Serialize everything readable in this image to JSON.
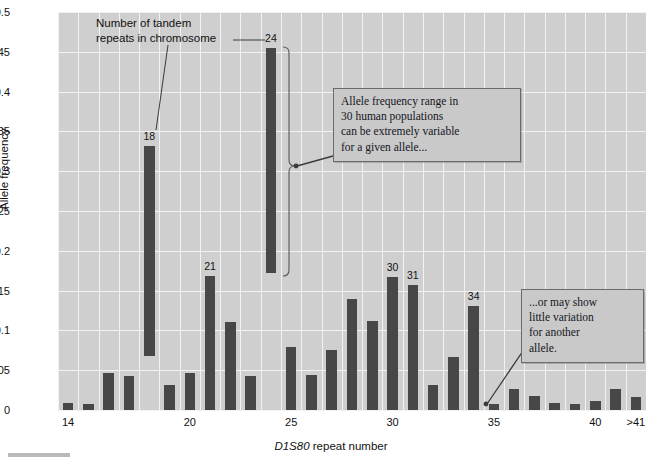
{
  "chart_data": {
    "type": "bar",
    "title": "",
    "xlabel": "D1S80 repeat number",
    "ylabel": "Allele frequency",
    "ylim": [
      0,
      0.5
    ],
    "ytick_labels": [
      "0",
      "0.05",
      "0.1",
      "0.15",
      "0.2",
      "0.25",
      "0.3",
      "0.35",
      "0.4",
      "0.45",
      "0.5"
    ],
    "ytick_values": [
      0,
      0.05,
      0.1,
      0.15,
      0.2,
      0.25,
      0.3,
      0.35,
      0.4,
      0.45,
      0.5
    ],
    "xtick_labels": [
      "14",
      "20",
      "25",
      "30",
      "35",
      "40",
      ">41"
    ],
    "xtick_values": [
      14,
      20,
      25,
      30,
      35,
      40,
      42
    ],
    "grid": true,
    "legend": "none",
    "bar_color": "#474747",
    "plot_background": "#cfcfcf",
    "categories": [
      "14",
      "15",
      "16",
      "17",
      "18",
      "19",
      "20",
      "21",
      "22",
      "23",
      "24",
      "25",
      "26",
      "27",
      "28",
      "29",
      "30",
      "31",
      "32",
      "33",
      "34",
      "35",
      "36",
      "37",
      "38",
      "39",
      "40",
      "41",
      ">41"
    ],
    "values": [
      0.009,
      0.008,
      0.046,
      0.043,
      0.332,
      0.032,
      0.047,
      0.168,
      0.111,
      0.043,
      0.455,
      0.079,
      0.044,
      0.076,
      0.139,
      0.112,
      0.167,
      0.157,
      0.031,
      0.067,
      0.131,
      0.007,
      0.027,
      0.017,
      0.009,
      0.008,
      0.011,
      0.026,
      0.016
    ],
    "bar_bottoms": [
      0,
      0,
      0,
      0,
      0.068,
      0,
      0,
      0,
      0,
      0,
      0.172,
      0,
      0,
      0,
      0,
      0,
      0,
      0,
      0,
      0,
      0,
      0,
      0,
      0,
      0,
      0,
      0,
      0,
      0
    ],
    "labeled_bars": [
      {
        "category": "18",
        "label": "18"
      },
      {
        "category": "21",
        "label": "21"
      },
      {
        "category": "24",
        "label": "24"
      },
      {
        "category": "30",
        "label": "30"
      },
      {
        "category": "31",
        "label": "31"
      },
      {
        "category": "34",
        "label": "34"
      }
    ],
    "annotations": [
      {
        "name": "tandem-repeats-note",
        "text": "Number of tandem repeats in chromosome",
        "points_to": "18"
      },
      {
        "name": "variable-allele-note",
        "text": "Allele frequency range in 30 human populations can be extremely variable for a given allele...",
        "points_to": "24"
      },
      {
        "name": "little-variation-note",
        "text": "...or may show little variation for another allele.",
        "points_to": "35"
      }
    ]
  },
  "axes": {
    "y_label": "Allele frequency",
    "x_label_italic": "D1S80",
    "x_label_rest": " repeat number"
  },
  "callouts": {
    "variable": {
      "line1": "Allele frequency range in",
      "line2": "30 human populations",
      "line3": "can be extremely variable",
      "line4": "for a given allele..."
    },
    "little": {
      "line1": "...or may show",
      "line2": "little variation",
      "line3": "for another",
      "line4": "allele."
    },
    "tandem": {
      "line1": "Number of tandem",
      "line2": "repeats in chromosome"
    }
  }
}
